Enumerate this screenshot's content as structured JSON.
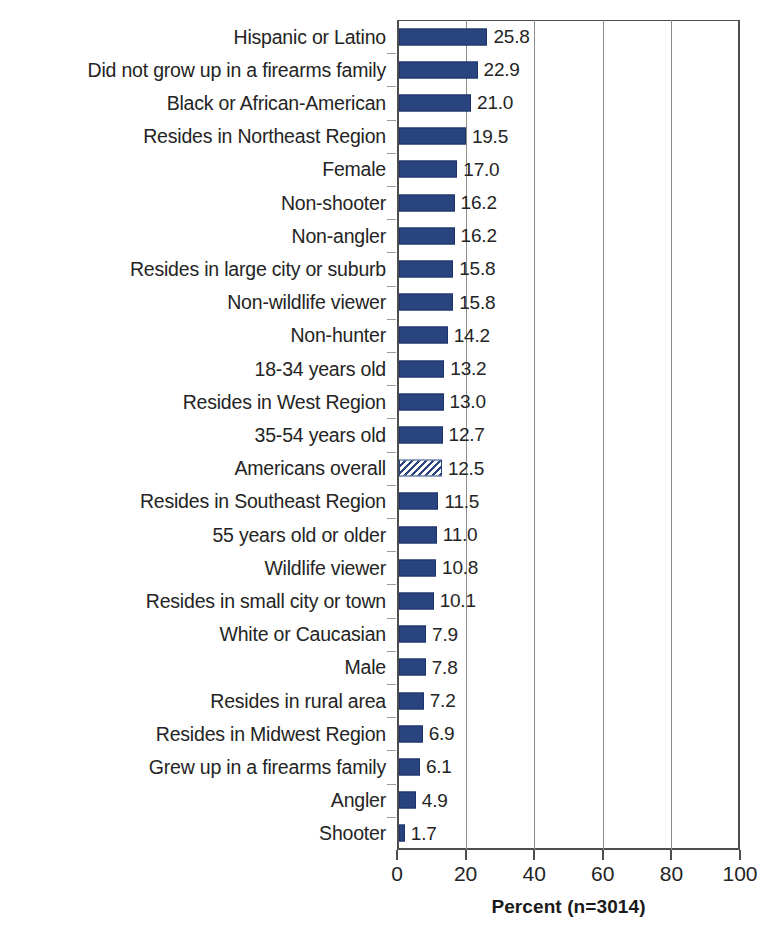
{
  "chart_data": {
    "type": "bar",
    "orientation": "horizontal",
    "title": "",
    "subtitle": "",
    "xlabel": "Percent (n=3014)",
    "ylabel": "",
    "xlim": [
      0,
      100
    ],
    "xticks": [
      0,
      20,
      40,
      60,
      80,
      100
    ],
    "xtick_labels": [
      "0",
      "20",
      "40",
      "60",
      "80",
      "100"
    ],
    "grid": true,
    "grid_axis": "x",
    "legend": "none",
    "value_labels": true,
    "value_label_precision": 1,
    "sort_order": "descending",
    "bar_color": "#2a4480",
    "highlight_color": "#2a4480",
    "highlight_fill": "hatched-diagonal",
    "highlight_category": "Americans overall",
    "categories": [
      "Hispanic or Latino",
      "Did not grow up in a firearms family",
      "Black or African-American",
      "Resides in Northeast Region",
      "Female",
      "Non-shooter",
      "Non-angler",
      "Resides in large city or suburb",
      "Non-wildlife viewer",
      "Non-hunter",
      "18-34 years old",
      "Resides in West Region",
      "35-54 years old",
      "Americans overall",
      "Resides in Southeast Region",
      "55 years old or older",
      "Wildlife viewer",
      "Resides in small city or town",
      "White or Caucasian",
      "Male",
      "Resides in rural area",
      "Resides in Midwest Region",
      "Grew up in a firearms family",
      "Angler",
      "Shooter"
    ],
    "values": [
      25.8,
      22.9,
      21.0,
      19.5,
      17.0,
      16.2,
      16.2,
      15.8,
      15.8,
      14.2,
      13.2,
      13.0,
      12.7,
      12.5,
      11.5,
      11.0,
      10.8,
      10.1,
      7.9,
      7.8,
      7.2,
      6.9,
      6.1,
      4.9,
      1.7
    ],
    "value_text": [
      "25.8",
      "22.9",
      "21.0",
      "19.5",
      "17.0",
      "16.2",
      "16.2",
      "15.8",
      "15.8",
      "14.2",
      "13.2",
      "13.0",
      "12.7",
      "12.5",
      "11.5",
      "11.0",
      "10.8",
      "10.1",
      "7.9",
      "7.8",
      "7.2",
      "6.9",
      "6.1",
      "4.9",
      "1.7"
    ]
  }
}
